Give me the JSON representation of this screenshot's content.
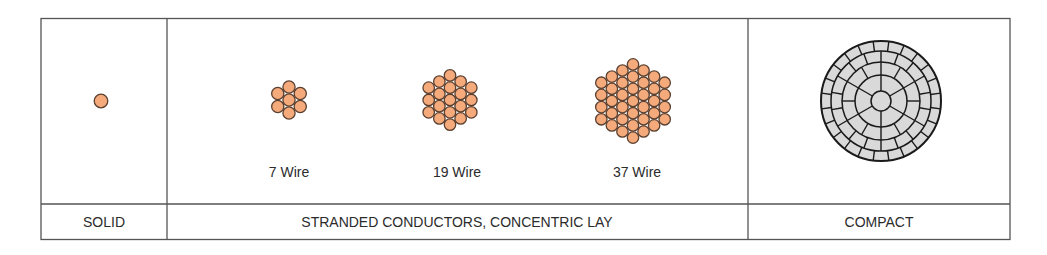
{
  "colors": {
    "wire_fill": "#F5AA7C",
    "wire_stroke": "#5B4030",
    "compact_fill": "#D9D9D9",
    "compact_stroke": "#1a1a1a",
    "border": "#555555"
  },
  "panels": [
    {
      "id": "solid",
      "footer": "SOLID"
    },
    {
      "id": "stranded",
      "footer": "STRANDED CONDUCTORS, CONCENTRIC LAY",
      "items": [
        {
          "label": "7 Wire",
          "layers": 1
        },
        {
          "label": "19 Wire",
          "layers": 2
        },
        {
          "label": "37 Wire",
          "layers": 3
        }
      ]
    },
    {
      "id": "compact",
      "footer": "COMPACT"
    }
  ]
}
